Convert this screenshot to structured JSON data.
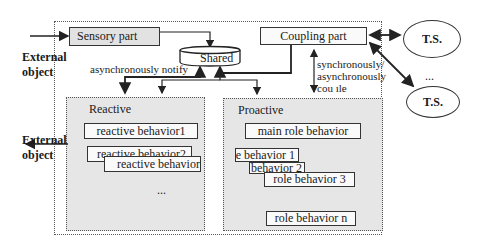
{
  "external_object_in": {
    "line1": "External",
    "line2": "object"
  },
  "external_object_out": {
    "line1": "External",
    "line2": "object"
  },
  "sensory_part": {
    "label": "Sensory part"
  },
  "shared": {
    "label": "Shared"
  },
  "coupling_part": {
    "label": "Coupling part"
  },
  "notify_label": "asynchronously notify",
  "couple_label": {
    "line1": "synchronously/",
    "line2": "asynchronously",
    "line3": "cou ıle"
  },
  "reactive": {
    "title": "Reactive",
    "behaviors": [
      "reactive behavior1",
      "reactive behavior2",
      "reactive  behavior"
    ],
    "ellipsis": "..."
  },
  "proactive": {
    "title": "Proactive",
    "main": "main role behavior",
    "behaviors": [
      "role  behavior  1",
      "role behavior  2",
      "role behavior 3",
      "role behavior n"
    ]
  },
  "ts_nodes": [
    "T.S.",
    "T.S."
  ],
  "ts_ellipsis": "...",
  "colors": {
    "line": "#222222",
    "panel_fill": "#e6e6e6",
    "box_fill": "#e2e2e2"
  }
}
